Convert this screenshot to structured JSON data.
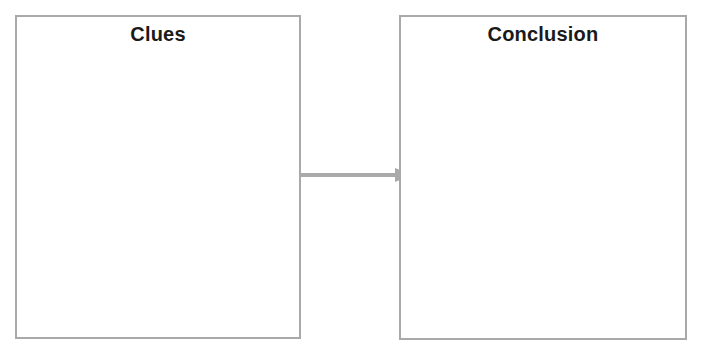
{
  "diagram": {
    "boxes": [
      {
        "title": "Clues",
        "content": ""
      },
      {
        "title": "Conclusion",
        "content": ""
      }
    ],
    "arrow": {
      "from": "Clues",
      "to": "Conclusion",
      "color": "#a9a9a9"
    }
  }
}
